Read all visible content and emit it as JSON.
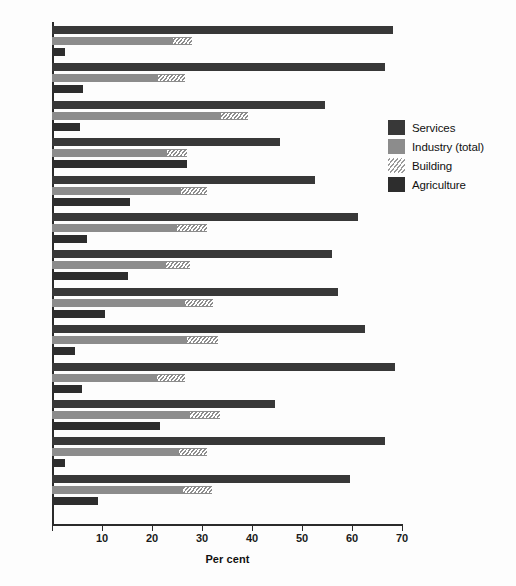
{
  "chart_data": {
    "type": "bar",
    "orientation": "horizontal",
    "title": "",
    "xlabel": "Per cent",
    "ylabel": "",
    "xlim": [
      0,
      70
    ],
    "xticks": [
      0,
      10,
      20,
      30,
      40,
      50,
      60,
      70
    ],
    "xticklabels": [
      "",
      "10",
      "20",
      "30",
      "40",
      "50",
      "60",
      "70"
    ],
    "grid": false,
    "legend_position": "right",
    "categories": [
      "B",
      "DK",
      "D",
      "GR",
      "E",
      "F",
      "IRL",
      "I",
      "L",
      "NL",
      "P",
      "UK",
      "EUR12"
    ],
    "series": [
      {
        "name": "Services",
        "color": "#383838",
        "values": [
          68.2,
          66.6,
          54.6,
          45.6,
          52.6,
          61.2,
          56.0,
          57.2,
          62.6,
          68.6,
          44.6,
          66.6,
          59.6
        ]
      },
      {
        "name": "Industry (total)",
        "color": "#8c8c8c",
        "values": [
          28.0,
          26.6,
          39.2,
          27.0,
          31.0,
          31.0,
          27.6,
          32.2,
          33.2,
          26.6,
          33.6,
          31.0,
          32.0
        ]
      },
      {
        "name": "Building",
        "color": "#ffffff",
        "hatch": "diagonal",
        "note": "sub-segment of Industry (total), drawn from start value to the Industry bar end",
        "start_values": [
          24.2,
          21.2,
          33.8,
          23.0,
          25.8,
          25.0,
          22.8,
          26.6,
          27.0,
          21.0,
          27.6,
          25.4,
          26.2
        ],
        "values": [
          28.0,
          26.6,
          39.2,
          27.0,
          31.0,
          31.0,
          27.6,
          32.2,
          33.2,
          26.6,
          33.6,
          31.0,
          32.0
        ]
      },
      {
        "name": "Agriculture",
        "color": "#2d2d2d",
        "values": [
          2.6,
          6.2,
          5.6,
          27.0,
          15.6,
          7.0,
          15.2,
          10.6,
          4.6,
          6.0,
          21.6,
          2.6,
          9.2
        ]
      }
    ],
    "legend": [
      "Services",
      "Industry (total)",
      "Building",
      "Agriculture"
    ]
  },
  "layout": {
    "plot_left_px": 52,
    "plot_top_px": 22,
    "plot_width_px": 350,
    "group_pitch_px": 37.4,
    "bar_height_px": 8
  }
}
